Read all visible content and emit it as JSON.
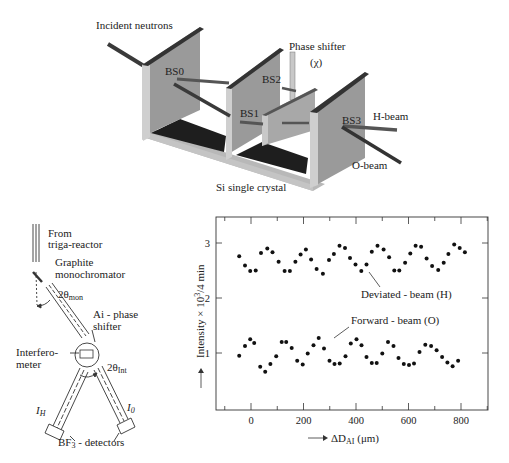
{
  "top_diagram": {
    "labels": {
      "incident": "Incident neutrons",
      "phase_shifter": "Phase shifter",
      "chi": "(χ)",
      "bs0": "BS0",
      "bs1": "BS1",
      "bs2": "BS2",
      "bs3": "BS3",
      "h_beam": "H-beam",
      "o_beam": "O-beam",
      "crystal": "Si single crystal"
    }
  },
  "schematic": {
    "labels": {
      "from": "From",
      "reactor": "triga-reactor",
      "graphite": "Graphite",
      "monochromator": "monochromator",
      "theta_mon": "2θ",
      "theta_mon_sub": "mon",
      "phase1": "Ai - phase",
      "phase2": "shifter",
      "interf1": "Interfero-",
      "interf2": "meter",
      "theta_int": "2θ",
      "theta_int_sub": "Int",
      "ih": "I",
      "ih_sub": "H",
      "io": "I",
      "io_sub": "0",
      "detectors": "BF",
      "detectors_sub": "3",
      "detectors_rest": " - detectors"
    }
  },
  "chart_data": {
    "type": "scatter",
    "title": "",
    "xlabel": "→ ΔD_AI (μm)",
    "ylabel": "→ Intensity × 10³/4 min",
    "xlabel_parts": {
      "arrow": "⟶",
      "main": "ΔD",
      "sub": "AI",
      "unit": " (μm)"
    },
    "ylabel_text": "Intensity × 10",
    "ylabel_sup": "3",
    "ylabel_tail": "/4 min",
    "xticks": [
      0,
      200,
      400,
      600,
      800
    ],
    "yticks": [
      1,
      2,
      3
    ],
    "xlim": [
      -130,
      900
    ],
    "ylim": [
      -0.05,
      3.45
    ],
    "grid": false,
    "annotations": [
      "Deviated - beam (H)",
      "Forward - beam (O)"
    ],
    "series": [
      {
        "name": "Deviated - beam (H)",
        "points": [
          [
            -45,
            2.76
          ],
          [
            -23,
            2.59
          ],
          [
            -3,
            2.49
          ],
          [
            18,
            2.5
          ],
          [
            38,
            2.82
          ],
          [
            62,
            2.9
          ],
          [
            82,
            2.83
          ],
          [
            105,
            2.66
          ],
          [
            128,
            2.49
          ],
          [
            148,
            2.49
          ],
          [
            169,
            2.66
          ],
          [
            189,
            2.79
          ],
          [
            209,
            2.88
          ],
          [
            229,
            2.7
          ],
          [
            250,
            2.53
          ],
          [
            274,
            2.44
          ],
          [
            297,
            2.69
          ],
          [
            316,
            2.8
          ],
          [
            337,
            2.95
          ],
          [
            358,
            2.91
          ],
          [
            377,
            2.73
          ],
          [
            398,
            2.61
          ],
          [
            420,
            2.49
          ],
          [
            440,
            2.61
          ],
          [
            460,
            2.84
          ],
          [
            482,
            2.95
          ],
          [
            505,
            2.88
          ],
          [
            526,
            2.74
          ],
          [
            546,
            2.5
          ],
          [
            565,
            2.5
          ],
          [
            587,
            2.64
          ],
          [
            607,
            2.81
          ],
          [
            627,
            2.95
          ],
          [
            648,
            2.93
          ],
          [
            669,
            2.72
          ],
          [
            690,
            2.58
          ],
          [
            713,
            2.51
          ],
          [
            734,
            2.64
          ],
          [
            752,
            2.8
          ],
          [
            774,
            2.97
          ],
          [
            795,
            2.91
          ],
          [
            815,
            2.83
          ]
        ]
      },
      {
        "name": "Forward - beam (O)",
        "points": [
          [
            -45,
            0.95
          ],
          [
            -23,
            1.13
          ],
          [
            -3,
            1.25
          ],
          [
            12,
            1.18
          ],
          [
            35,
            0.75
          ],
          [
            54,
            0.66
          ],
          [
            74,
            0.8
          ],
          [
            96,
            0.94
          ],
          [
            117,
            1.2
          ],
          [
            134,
            1.2
          ],
          [
            155,
            1.09
          ],
          [
            176,
            0.86
          ],
          [
            197,
            0.79
          ],
          [
            216,
            0.99
          ],
          [
            238,
            1.14
          ],
          [
            258,
            1.27
          ],
          [
            278,
            1.08
          ],
          [
            299,
            0.86
          ],
          [
            318,
            0.8
          ],
          [
            338,
            0.81
          ],
          [
            360,
            0.94
          ],
          [
            380,
            1.17
          ],
          [
            402,
            1.25
          ],
          [
            421,
            1.14
          ],
          [
            440,
            0.93
          ],
          [
            460,
            0.82
          ],
          [
            479,
            0.82
          ],
          [
            500,
            0.99
          ],
          [
            522,
            1.2
          ],
          [
            543,
            1.13
          ],
          [
            562,
            0.91
          ],
          [
            582,
            0.8
          ],
          [
            602,
            0.78
          ],
          [
            621,
            0.81
          ],
          [
            642,
            1.02
          ],
          [
            664,
            1.15
          ],
          [
            686,
            1.13
          ],
          [
            707,
            1.05
          ],
          [
            728,
            0.93
          ],
          [
            748,
            0.83
          ],
          [
            768,
            0.76
          ],
          [
            789,
            0.86
          ]
        ]
      }
    ]
  }
}
